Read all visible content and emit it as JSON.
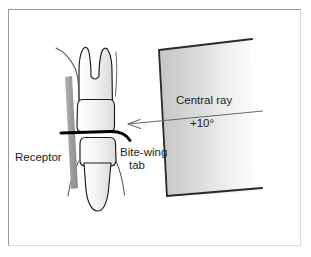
{
  "figure": {
    "background_color": "#ffffff",
    "border_color": "#9a9a9a"
  },
  "labels": {
    "receptor": "Receptor",
    "bitewing_tab_line1": "Bite-wing",
    "bitewing_tab_line2": "tab",
    "central_ray": "Central ray",
    "angulation": "+10°"
  },
  "colors": {
    "outline": "#1a1a1a",
    "tooth_fill": "#f2f2f2",
    "tooth_shadow": "#d8d8d8",
    "receptor_fill": "#9e9e9e",
    "tab_stroke": "#000000",
    "pid_light": "#cfcfcf",
    "pid_dark": "#fdfdfd",
    "pid_edge": "#2a2a2a",
    "ray_line": "#6b6b6b",
    "gum_line": "#555555",
    "text": "#1d1d1d"
  },
  "elements": {
    "upper_molar": "upper-molar",
    "lower_molar": "lower-molar",
    "receptor_bar": "receptor-bar",
    "bitewing_tab": "bite-wing-tab",
    "pid_cone": "position-indicating-device",
    "central_ray_arrow": "central-ray-arrow"
  }
}
